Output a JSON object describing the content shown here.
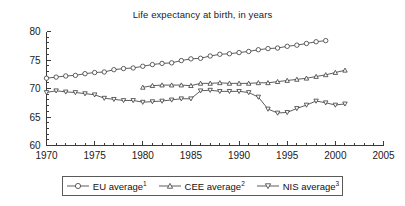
{
  "chart_data": {
    "type": "line",
    "title": "Life expectancy at birth, in years",
    "xlabel": "",
    "ylabel": "",
    "xlim": [
      1970,
      2005
    ],
    "ylim": [
      60,
      80
    ],
    "yticks": [
      60,
      65,
      70,
      75,
      80
    ],
    "xticks": [
      1970,
      1975,
      1980,
      1985,
      1990,
      1995,
      2000,
      2005
    ],
    "minor_tick_step": 1,
    "grid": false,
    "legend_position": "bottom",
    "series": [
      {
        "name": "EU average",
        "footnote_marker": "1",
        "marker": "circle",
        "x": [
          1970,
          1971,
          1972,
          1973,
          1974,
          1975,
          1976,
          1977,
          1978,
          1979,
          1980,
          1981,
          1982,
          1983,
          1984,
          1985,
          1986,
          1987,
          1988,
          1989,
          1990,
          1991,
          1992,
          1993,
          1994,
          1995,
          1996,
          1997,
          1998,
          1999
        ],
        "values": [
          71.8,
          72.0,
          72.2,
          72.3,
          72.6,
          72.8,
          72.9,
          73.3,
          73.5,
          73.6,
          73.9,
          74.2,
          74.4,
          74.5,
          74.9,
          75.2,
          75.3,
          75.7,
          76.0,
          76.1,
          76.3,
          76.5,
          76.8,
          77.0,
          77.1,
          77.4,
          77.6,
          77.9,
          78.2,
          78.4
        ]
      },
      {
        "name": "CEE average",
        "footnote_marker": "2",
        "marker": "triangle-up",
        "x": [
          1980,
          1981,
          1982,
          1983,
          1984,
          1985,
          1986,
          1987,
          1988,
          1989,
          1990,
          1991,
          1992,
          1993,
          1994,
          1995,
          1996,
          1997,
          1998,
          1999,
          2000,
          2001
        ],
        "values": [
          70.2,
          70.5,
          70.6,
          70.6,
          70.6,
          70.5,
          70.9,
          70.9,
          71.0,
          70.9,
          70.9,
          70.9,
          71.0,
          71.0,
          71.2,
          71.4,
          71.6,
          71.8,
          72.1,
          72.4,
          72.8,
          73.2
        ]
      },
      {
        "name": "NIS average",
        "footnote_marker": "3",
        "marker": "triangle-down",
        "x": [
          1970,
          1971,
          1972,
          1973,
          1974,
          1975,
          1976,
          1977,
          1978,
          1979,
          1980,
          1981,
          1982,
          1983,
          1984,
          1985,
          1986,
          1987,
          1988,
          1989,
          1990,
          1991,
          1992,
          1993,
          1994,
          1995,
          1996,
          1997,
          1998,
          1999,
          2000,
          2001
        ],
        "values": [
          69.3,
          69.6,
          69.4,
          69.3,
          69.1,
          68.9,
          68.3,
          68.1,
          67.9,
          67.9,
          67.6,
          67.7,
          67.8,
          68.0,
          68.2,
          68.2,
          69.6,
          69.7,
          69.5,
          69.5,
          69.5,
          69.3,
          68.5,
          66.4,
          65.7,
          65.8,
          66.5,
          67.1,
          67.8,
          67.5,
          67.1,
          67.3
        ]
      }
    ]
  },
  "legend": {
    "entries": [
      {
        "label": "EU average",
        "sup": "1"
      },
      {
        "label": "CEE average",
        "sup": "2"
      },
      {
        "label": "NIS average",
        "sup": "3"
      }
    ]
  },
  "axes": {
    "y_tick_labels": [
      "80",
      "75",
      "70",
      "65",
      "60"
    ],
    "x_tick_labels": [
      "1970",
      "1975",
      "1980",
      "1985",
      "1990",
      "1995",
      "2000",
      "2005"
    ]
  }
}
